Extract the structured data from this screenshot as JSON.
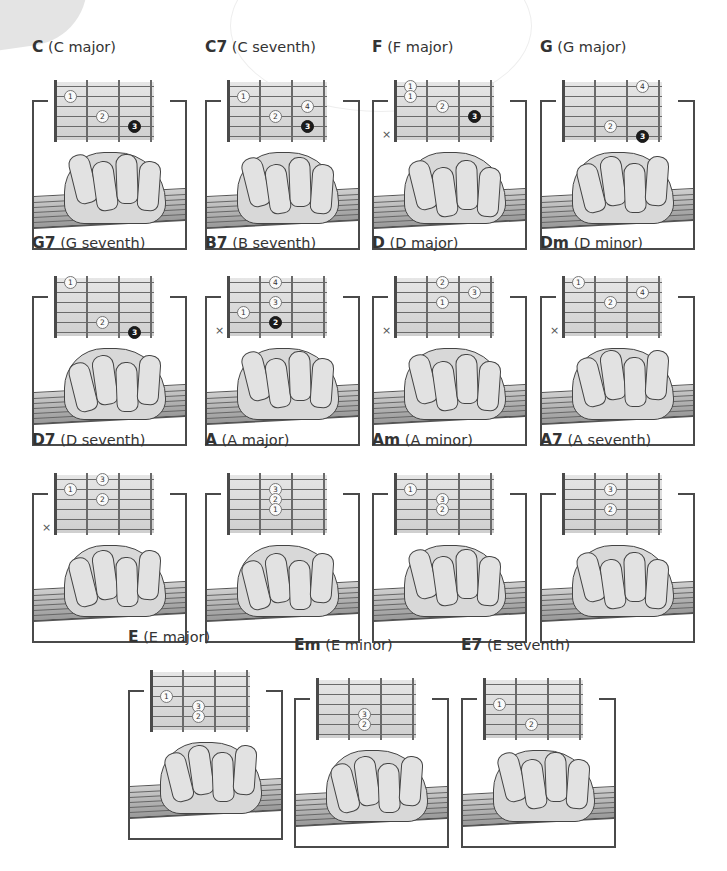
{
  "chords": [
    {
      "symbol": "C",
      "name": "(C major)",
      "x": 32,
      "y": 62,
      "mute": null,
      "dots": [
        {
          "f": 1,
          "s": 2,
          "n": "1"
        },
        {
          "f": 2,
          "s": 4,
          "n": "2"
        },
        {
          "f": 3,
          "s": 5,
          "n": "3",
          "dark": true
        }
      ]
    },
    {
      "symbol": "C7",
      "name": "(C seventh)",
      "x": 205,
      "y": 62,
      "mute": null,
      "dots": [
        {
          "f": 1,
          "s": 2,
          "n": "1"
        },
        {
          "f": 3,
          "s": 3,
          "n": "4"
        },
        {
          "f": 2,
          "s": 4,
          "n": "2"
        },
        {
          "f": 3,
          "s": 5,
          "n": "3",
          "dark": true
        }
      ]
    },
    {
      "symbol": "F",
      "name": "(F major)",
      "x": 372,
      "y": 62,
      "mute": "×",
      "dots": [
        {
          "f": 1,
          "s": 1,
          "n": "1"
        },
        {
          "f": 1,
          "s": 2,
          "n": "1"
        },
        {
          "f": 2,
          "s": 3,
          "n": "2"
        },
        {
          "f": 3,
          "s": 4,
          "n": "3",
          "dark": true
        }
      ]
    },
    {
      "symbol": "G",
      "name": "(G major)",
      "x": 540,
      "y": 62,
      "mute": null,
      "dots": [
        {
          "f": 3,
          "s": 1,
          "n": "4"
        },
        {
          "f": 2,
          "s": 5,
          "n": "2"
        },
        {
          "f": 3,
          "s": 6,
          "n": "3",
          "dark": true
        }
      ]
    },
    {
      "symbol": "G7",
      "name": "(G seventh)",
      "x": 32,
      "y": 258,
      "mute": null,
      "dots": [
        {
          "f": 1,
          "s": 1,
          "n": "1"
        },
        {
          "f": 2,
          "s": 5,
          "n": "2"
        },
        {
          "f": 3,
          "s": 6,
          "n": "3",
          "dark": true
        }
      ]
    },
    {
      "symbol": "B7",
      "name": "(B seventh)",
      "x": 205,
      "y": 258,
      "mute": "×",
      "dots": [
        {
          "f": 2,
          "s": 1,
          "n": "4"
        },
        {
          "f": 2,
          "s": 3,
          "n": "3"
        },
        {
          "f": 1,
          "s": 4,
          "n": "1"
        },
        {
          "f": 2,
          "s": 5,
          "n": "2",
          "dark": true
        }
      ]
    },
    {
      "symbol": "D",
      "name": "(D major)",
      "x": 372,
      "y": 258,
      "mute": "×",
      "dots": [
        {
          "f": 2,
          "s": 1,
          "n": "2"
        },
        {
          "f": 3,
          "s": 2,
          "n": "3"
        },
        {
          "f": 2,
          "s": 3,
          "n": "1"
        }
      ]
    },
    {
      "symbol": "Dm",
      "name": "(D minor)",
      "x": 540,
      "y": 258,
      "mute": "×",
      "dots": [
        {
          "f": 1,
          "s": 1,
          "n": "1"
        },
        {
          "f": 3,
          "s": 2,
          "n": "4"
        },
        {
          "f": 2,
          "s": 3,
          "n": "2"
        }
      ]
    },
    {
      "symbol": "D7",
      "name": "(D seventh)",
      "x": 32,
      "y": 455,
      "mute": "×",
      "dots": [
        {
          "f": 2,
          "s": 1,
          "n": "3"
        },
        {
          "f": 1,
          "s": 2,
          "n": "1"
        },
        {
          "f": 2,
          "s": 3,
          "n": "2"
        }
      ]
    },
    {
      "symbol": "A",
      "name": "(A major)",
      "x": 205,
      "y": 455,
      "mute": null,
      "dots": [
        {
          "f": 2,
          "s": 2,
          "n": "3"
        },
        {
          "f": 2,
          "s": 3,
          "n": "2"
        },
        {
          "f": 2,
          "s": 4,
          "n": "1"
        }
      ]
    },
    {
      "symbol": "Am",
      "name": "(A minor)",
      "x": 372,
      "y": 455,
      "mute": null,
      "dots": [
        {
          "f": 1,
          "s": 2,
          "n": "1"
        },
        {
          "f": 2,
          "s": 3,
          "n": "3"
        },
        {
          "f": 2,
          "s": 4,
          "n": "2"
        }
      ]
    },
    {
      "symbol": "A7",
      "name": "(A seventh)",
      "x": 540,
      "y": 455,
      "mute": null,
      "dots": [
        {
          "f": 2,
          "s": 2,
          "n": "3"
        },
        {
          "f": 2,
          "s": 4,
          "n": "2"
        }
      ]
    },
    {
      "symbol": "E",
      "name": "(E major)",
      "x": 128,
      "y": 652,
      "mute": null,
      "dots": [
        {
          "f": 1,
          "s": 3,
          "n": "1"
        },
        {
          "f": 2,
          "s": 4,
          "n": "3"
        },
        {
          "f": 2,
          "s": 5,
          "n": "2"
        }
      ]
    },
    {
      "symbol": "Em",
      "name": "(E minor)",
      "x": 294,
      "y": 660,
      "mute": null,
      "dots": [
        {
          "f": 2,
          "s": 4,
          "n": "3"
        },
        {
          "f": 2,
          "s": 5,
          "n": "2"
        }
      ]
    },
    {
      "symbol": "E7",
      "name": "(E seventh)",
      "x": 461,
      "y": 660,
      "mute": null,
      "dots": [
        {
          "f": 1,
          "s": 3,
          "n": "1"
        },
        {
          "f": 2,
          "s": 5,
          "n": "2"
        }
      ]
    }
  ]
}
